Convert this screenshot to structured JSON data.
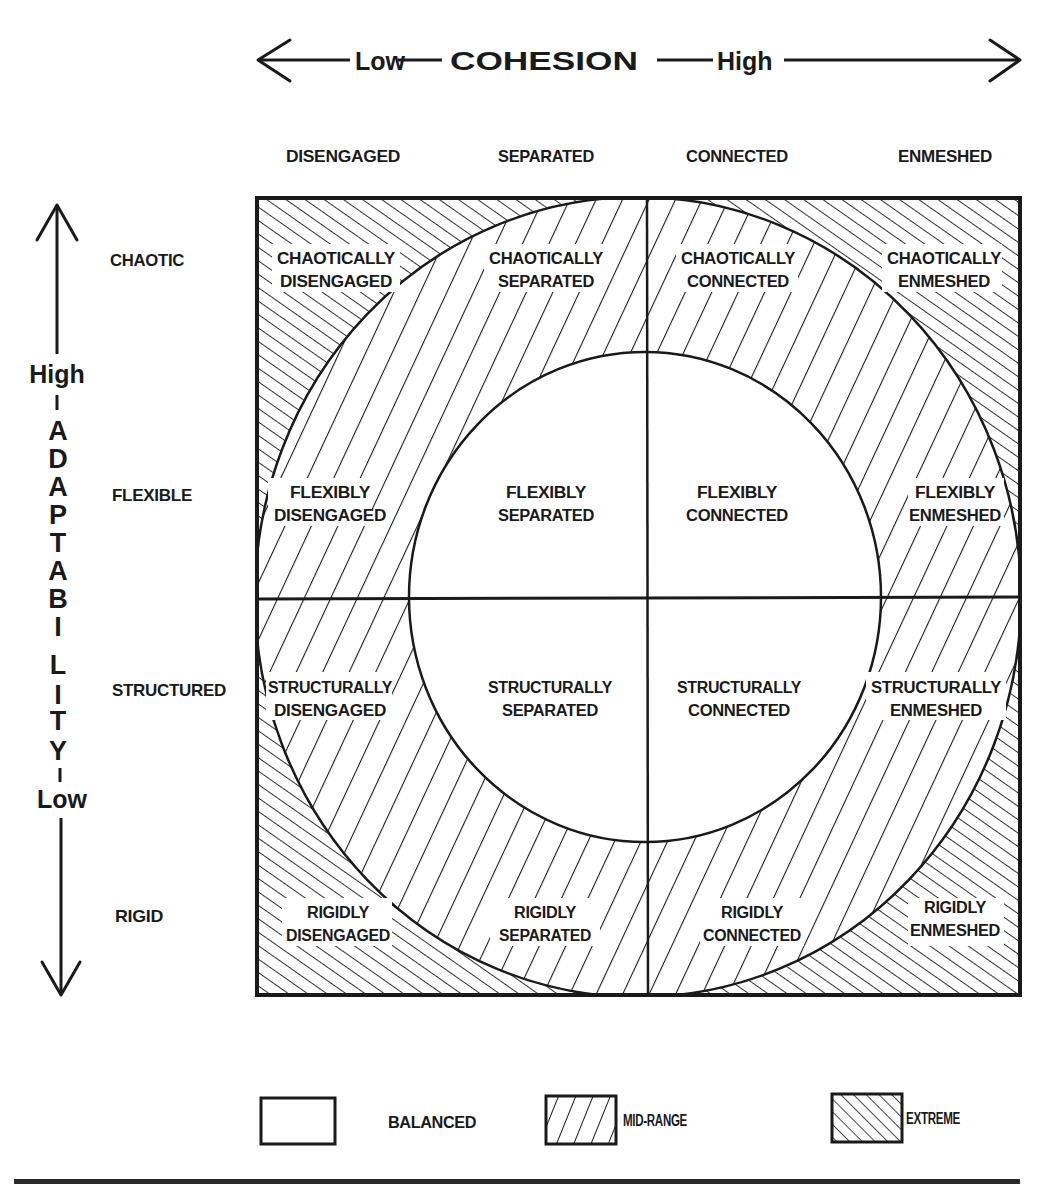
{
  "cohesion_axis": {
    "low_label": "Low",
    "title": "COHESION",
    "high_label": "High"
  },
  "adaptability_axis": {
    "high_label": "High",
    "title_letters": [
      "A",
      "D",
      "A",
      "P",
      "T",
      "A",
      "B",
      "I",
      "L",
      "I",
      "T",
      "Y"
    ],
    "low_label": "Low"
  },
  "cohesion_levels": [
    "DISENGAGED",
    "SEPARATED",
    "CONNECTED",
    "ENMESHED"
  ],
  "adaptability_levels": [
    "CHAOTIC",
    "FLEXIBLE",
    "STRUCTURED",
    "RIGID"
  ],
  "grid": {
    "rows": [
      {
        "level": "CHAOTIC",
        "cells": [
          {
            "line1": "CHAOTICALLY",
            "line2": "DISENGAGED",
            "type": "extreme"
          },
          {
            "line1": "CHAOTICALLY",
            "line2": "SEPARATED",
            "type": "mid-range"
          },
          {
            "line1": "CHAOTICALLY",
            "line2": "CONNECTED",
            "type": "mid-range"
          },
          {
            "line1": "CHAOTICALLY",
            "line2": "ENMESHED",
            "type": "extreme"
          }
        ]
      },
      {
        "level": "FLEXIBLE",
        "cells": [
          {
            "line1": "FLEXIBLY",
            "line2": "DISENGAGED",
            "type": "mid-range"
          },
          {
            "line1": "FLEXIBLY",
            "line2": "SEPARATED",
            "type": "balanced"
          },
          {
            "line1": "FLEXIBLY",
            "line2": "CONNECTED",
            "type": "balanced"
          },
          {
            "line1": "FLEXIBLY",
            "line2": "ENMESHED",
            "type": "mid-range"
          }
        ]
      },
      {
        "level": "STRUCTURED",
        "cells": [
          {
            "line1": "STRUCTURALLY",
            "line2": "DISENGAGED",
            "type": "mid-range"
          },
          {
            "line1": "STRUCTURALLY",
            "line2": "SEPARATED",
            "type": "balanced"
          },
          {
            "line1": "STRUCTURALLY",
            "line2": "CONNECTED",
            "type": "balanced"
          },
          {
            "line1": "STRUCTURALLY",
            "line2": "ENMESHED",
            "type": "mid-range"
          }
        ]
      },
      {
        "level": "RIGID",
        "cells": [
          {
            "line1": "RIGIDLY",
            "line2": "DISENGAGED",
            "type": "extreme"
          },
          {
            "line1": "RIGIDLY",
            "line2": "SEPARATED",
            "type": "mid-range"
          },
          {
            "line1": "RIGIDLY",
            "line2": "CONNECTED",
            "type": "mid-range"
          },
          {
            "line1": "RIGIDLY",
            "line2": "ENMESHED",
            "type": "extreme"
          }
        ]
      }
    ]
  },
  "legend": [
    {
      "label": "BALANCED",
      "pattern": "blank"
    },
    {
      "label": "MID-RANGE",
      "pattern": "forward-hatch"
    },
    {
      "label": "EXTREME",
      "pattern": "back-hatch"
    }
  ],
  "colors": {
    "ink": "#1a1a1a",
    "paper": "#ffffff"
  }
}
